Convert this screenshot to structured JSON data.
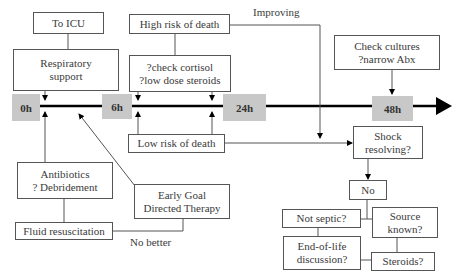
{
  "timeline": {
    "markers": [
      {
        "id": "0h",
        "label": "0h"
      },
      {
        "id": "6h",
        "label": "6h"
      },
      {
        "id": "24h",
        "label": "24h"
      },
      {
        "id": "48h",
        "label": "48h"
      }
    ]
  },
  "boxes": {
    "to_icu": "To ICU",
    "respiratory_support": [
      "Respiratory",
      "support"
    ],
    "high_risk": "High risk of death",
    "cortisol": [
      "?check cortisol",
      "?low dose steroids"
    ],
    "check_cultures": [
      "Check cultures",
      "?narrow Abx"
    ],
    "low_risk": "Low risk of death",
    "shock_resolving": [
      "Shock",
      "resolving?"
    ],
    "no": "No",
    "not_septic": "Not septic?",
    "source_known": [
      "Source",
      "known?"
    ],
    "end_of_life": [
      "End-of-life",
      "discussion?"
    ],
    "steroids": "Steroids?",
    "antibiotics": [
      "Antibiotics",
      "? Debridement"
    ],
    "egdt": [
      "Early Goal",
      "Directed Therapy"
    ],
    "fluid": "Fluid resuscitation"
  },
  "labels": {
    "improving": "Improving",
    "no_better": "No better"
  },
  "colors": {
    "timeline": "#000000",
    "marker_bg": "#c8c8c8",
    "connector": "#555555"
  }
}
